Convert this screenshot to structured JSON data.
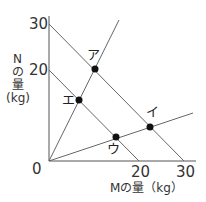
{
  "diagram": {
    "y_axis": {
      "label_lines": [
        "N",
        "の",
        "量",
        "(kg)"
      ],
      "ticks": [
        "30",
        "20"
      ]
    },
    "x_axis": {
      "label": "Mの量（kg）",
      "ticks": [
        "20",
        "30"
      ]
    },
    "origin_label": "0",
    "points": [
      {
        "id": "a",
        "label": "ア"
      },
      {
        "id": "e",
        "label": "エ"
      },
      {
        "id": "i",
        "label": "イ"
      },
      {
        "id": "u",
        "label": "ウ"
      }
    ]
  }
}
